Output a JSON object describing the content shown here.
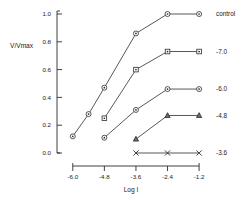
{
  "chart_data": {
    "type": "line",
    "title": "",
    "xlabel": "Log I",
    "ylabel": "V/Vmax",
    "x": [
      -6.0,
      -4.8,
      -3.6,
      -2.4,
      -1.2
    ],
    "xticklabels": [
      "-6.0",
      "-4.8",
      "-3.6",
      "-2.4",
      "-1.2"
    ],
    "yticklabels": [
      "0.0",
      "0.2",
      "0.4",
      "0.6",
      "0.8",
      "1.0"
    ],
    "yticks": [
      0.0,
      0.2,
      0.4,
      0.6,
      0.8,
      1.0
    ],
    "xlim": [
      -6.6,
      -0.9
    ],
    "ylim": [
      0.0,
      1.0
    ],
    "grid": false,
    "legend_position": "right-of-axes",
    "series": [
      {
        "name": "control",
        "label": "control",
        "marker": "circle",
        "points": [
          {
            "x": -6.0,
            "y": 0.12
          },
          {
            "x": -5.4,
            "y": 0.28
          },
          {
            "x": -4.8,
            "y": 0.47
          },
          {
            "x": -3.6,
            "y": 0.86
          },
          {
            "x": -2.4,
            "y": 1.0
          },
          {
            "x": -1.2,
            "y": 1.0
          }
        ]
      },
      {
        "name": "-7.0",
        "label": "-7.0",
        "marker": "square",
        "points": [
          {
            "x": -4.8,
            "y": 0.25
          },
          {
            "x": -3.6,
            "y": 0.6
          },
          {
            "x": -2.4,
            "y": 0.73
          },
          {
            "x": -1.2,
            "y": 0.73
          }
        ]
      },
      {
        "name": "-6.0",
        "label": "-6.0",
        "marker": "circle",
        "points": [
          {
            "x": -4.8,
            "y": 0.11
          },
          {
            "x": -3.6,
            "y": 0.31
          },
          {
            "x": -2.4,
            "y": 0.46
          },
          {
            "x": -1.2,
            "y": 0.46
          }
        ]
      },
      {
        "name": "-4.8",
        "label": "-4.8",
        "marker": "triangle",
        "points": [
          {
            "x": -3.6,
            "y": 0.1
          },
          {
            "x": -2.4,
            "y": 0.27
          },
          {
            "x": -1.2,
            "y": 0.27
          }
        ]
      },
      {
        "name": "-3.6",
        "label": "-3.6",
        "marker": "x",
        "points": [
          {
            "x": -3.6,
            "y": 0.0
          },
          {
            "x": -2.4,
            "y": 0.0
          },
          {
            "x": -1.2,
            "y": 0.0
          }
        ]
      }
    ],
    "colors": {
      "axis": "#2b2b2b",
      "line": "#3a3a3a",
      "marker_fill": "#ffffff",
      "text": "#1a1a1a",
      "background": "#ffffff"
    }
  }
}
